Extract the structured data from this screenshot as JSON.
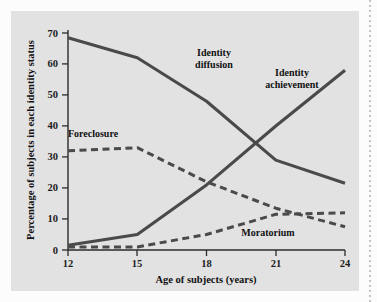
{
  "figure": {
    "panel_background": "#e2e2e2",
    "page_background": "#fcfcfc",
    "line_color": "#4a4a4a",
    "axis_color": "#2b2b2b"
  },
  "chart_data": {
    "type": "line",
    "title": "",
    "xlabel": "Age of subjects (years)",
    "ylabel": "Percentage of subjects in each identity status",
    "x": [
      12,
      15,
      18,
      21,
      24
    ],
    "xticklabels": [
      "12",
      "15",
      "18",
      "21",
      "24"
    ],
    "yticks": [
      0,
      10,
      20,
      30,
      40,
      50,
      60,
      70
    ],
    "yticklabels": [
      "0",
      "10",
      "20",
      "30",
      "40",
      "50",
      "60",
      "70"
    ],
    "xlim": [
      12,
      24
    ],
    "ylim": [
      0,
      70
    ],
    "grid": false,
    "legend_position": "inline-annotations",
    "series": [
      {
        "name": "Identity diffusion",
        "style": "solid",
        "label_lines": [
          "Identity",
          "diffusion"
        ],
        "values": [
          68.5,
          62,
          48,
          29,
          21.5
        ]
      },
      {
        "name": "Identity achievement",
        "style": "solid",
        "label_lines": [
          "Identity",
          "achievement"
        ],
        "values": [
          1.5,
          5,
          21,
          40,
          58
        ]
      },
      {
        "name": "Foreclosure",
        "style": "dashed",
        "label_lines": [
          "Foreclosure"
        ],
        "values": [
          32,
          33,
          22,
          13.5,
          7.5
        ]
      },
      {
        "name": "Moratorium",
        "style": "dashed",
        "label_lines": [
          "Moratorium"
        ],
        "values": [
          1,
          1,
          5,
          11.5,
          12
        ]
      }
    ],
    "annotations": [
      {
        "text": "Identity",
        "x_px": 214,
        "y_px": 56
      },
      {
        "text": "diffusion",
        "x_px": 214,
        "y_px": 68
      },
      {
        "text": "Identity",
        "x_px": 292,
        "y_px": 76
      },
      {
        "text": "achievement",
        "x_px": 292,
        "y_px": 88
      },
      {
        "text": "Foreclosure",
        "x_px": 93,
        "y_px": 137
      },
      {
        "text": "Moratorium",
        "x_px": 268,
        "y_px": 236
      }
    ]
  }
}
